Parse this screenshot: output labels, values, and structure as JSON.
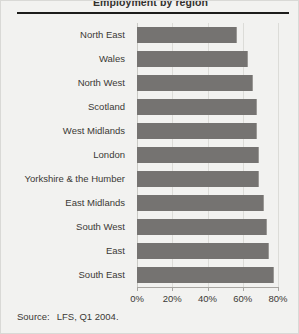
{
  "chart_data": {
    "type": "bar",
    "orientation": "horizontal",
    "title": "Employment by region",
    "categories": [
      "North East",
      "Wales",
      "North West",
      "Scotland",
      "West Midlands",
      "London",
      "Yorkshire & the Humber",
      "East Midlands",
      "South West",
      "East",
      "South East"
    ],
    "values": [
      57,
      63,
      66,
      68,
      68,
      69,
      69,
      72,
      74,
      75,
      78
    ],
    "xlabel": "",
    "ylabel": "",
    "xlim": [
      0,
      80
    ],
    "xticks": [
      0,
      20,
      40,
      60,
      80
    ],
    "xtick_labels": [
      "0%",
      "20%",
      "40%",
      "60%",
      "80%"
    ],
    "grid": true,
    "legend": false,
    "bar_color": "#757371",
    "background_color": "#f2f2f0"
  },
  "source": {
    "label": "Source:",
    "text": "LFS, Q1 2004."
  }
}
